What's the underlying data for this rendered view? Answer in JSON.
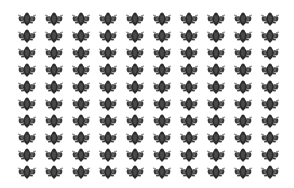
{
  "canvas": {
    "width": 294,
    "height": 188,
    "background_color": "#ffffff"
  },
  "pattern": {
    "name": "beetle-motif-tiling",
    "description": "Repeated dark insect-like motif arranged in a regular grid on a white field",
    "columns": 10,
    "rows": 10,
    "tile_count": 100,
    "origin_x": 16,
    "origin_y": 12,
    "pitch_x": 27,
    "pitch_y": 17,
    "tile_width": 22,
    "tile_height": 15
  },
  "motif": {
    "name": "beetle-glyph",
    "body_color": "#2b2b2b",
    "body_highlight_color": "#4a4a4a",
    "appendage_color": "#3a3a3a",
    "edge_color": "#8e8e8e",
    "accent_color": "#646464"
  }
}
